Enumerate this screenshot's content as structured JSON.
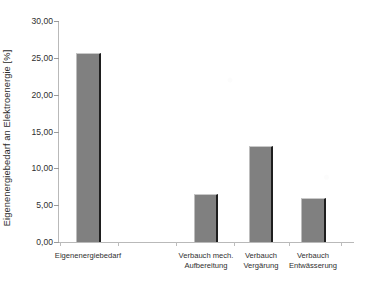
{
  "chart_data": {
    "type": "bar",
    "title": "",
    "xlabel": "",
    "ylabel": "Eigenenergiebedarf an Elektroenergie [%]",
    "categories": [
      "Eigenenergiebedarf",
      "Verbauch mech.\nAufbereitung",
      "Verbauch\nVergärung",
      "Verbauch\nEntwässerung"
    ],
    "values": [
      25.7,
      6.5,
      13.0,
      6.0
    ],
    "ylim": [
      0,
      30
    ],
    "ytick_values": [
      0,
      5,
      10,
      15,
      20,
      25,
      30
    ],
    "ytick_labels": [
      "0,00",
      "5,00",
      "10,00",
      "15,00",
      "20,00",
      "25,00",
      "30,00"
    ],
    "grid": false,
    "legend": false,
    "bar_color": "#808080",
    "bar_edge_color": "#1e1e1e",
    "axis_color": "#b9b9b9"
  }
}
